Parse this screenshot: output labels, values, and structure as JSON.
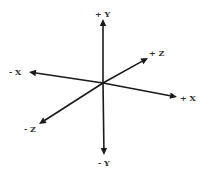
{
  "diagram": {
    "origin": {
      "x": 103,
      "y": 83
    },
    "colors": {
      "axis": "#1a1a1a",
      "label": "#333333",
      "background": "#ffffff"
    },
    "axes": [
      {
        "id": "pos-y",
        "label": "+ Y",
        "tip": {
          "x": 103,
          "y": 19
        },
        "label_pos": {
          "x": 95,
          "y": 17
        }
      },
      {
        "id": "neg-y",
        "label": "- Y",
        "tip": {
          "x": 104,
          "y": 155
        },
        "label_pos": {
          "x": 98,
          "y": 166
        }
      },
      {
        "id": "neg-x",
        "label": "- X",
        "tip": {
          "x": 29,
          "y": 72
        },
        "label_pos": {
          "x": 9,
          "y": 75
        }
      },
      {
        "id": "pos-x",
        "label": "+ X",
        "tip": {
          "x": 177,
          "y": 97
        },
        "label_pos": {
          "x": 180,
          "y": 101
        }
      },
      {
        "id": "pos-z",
        "label": "+ Z",
        "tip": {
          "x": 148,
          "y": 58
        },
        "label_pos": {
          "x": 149,
          "y": 56
        }
      },
      {
        "id": "neg-z",
        "label": "- Z",
        "tip": {
          "x": 39,
          "y": 124
        },
        "label_pos": {
          "x": 24,
          "y": 132
        }
      }
    ]
  }
}
